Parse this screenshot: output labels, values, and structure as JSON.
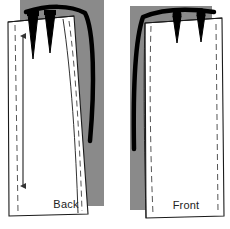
{
  "figure": {
    "kind": "sewing-pattern-diagram",
    "width": 230,
    "height": 229,
    "background_color": "#ffffff"
  },
  "colors": {
    "background": "#ffffff",
    "shadow_gray": "#8a8a8a",
    "piece_fill": "#ffffff",
    "outline": "#1a1a1a",
    "thick_stroke": "#000000",
    "dashed_stitch": "#555555",
    "arrow": "#333333",
    "label_text": "#222222"
  },
  "panels": [
    {
      "id": "back",
      "label": "Back",
      "label_x": 66,
      "label_y": 208,
      "shadow": {
        "name": "back-shadow-block",
        "x": 20,
        "y": 0,
        "width": 84,
        "height": 206,
        "color": "#8a8a8a"
      },
      "piece_outline_points": "8,22 74,16 88,214 9,216",
      "stitch_line_points": "15,25 18,212",
      "side_stitch_points": "69,22 82,211",
      "grainline_arrow": {
        "name": "grainline-arrow",
        "x": 23,
        "y_top": 33,
        "y_bottom": 189,
        "double_headed": true
      },
      "darts": [
        {
          "name": "dart-back-1",
          "apex_x": 33,
          "apex_y": 58,
          "top_left_x": 28,
          "top_right_x": 38,
          "top_y": 18
        },
        {
          "name": "dart-back-2",
          "apex_x": 50,
          "apex_y": 52,
          "top_left_x": 45,
          "top_right_x": 55,
          "top_y": 17
        }
      ],
      "thick_curve": {
        "name": "back-side-seam-heavy-curve",
        "description": "heavy black curved side seam sweeping right then down",
        "path": "M 26 12 C 48 6, 68 6, 84 12 C 92 26, 94 80, 90 140"
      }
    },
    {
      "id": "front",
      "label": "Front",
      "label_x": 186,
      "label_y": 209,
      "shadow": {
        "name": "front-shadow-block",
        "x": 130,
        "y": 6,
        "width": 82,
        "height": 204,
        "color": "#8a8a8a"
      },
      "piece_outline_points": "144,22 222,18 224,216 145,218",
      "stitch_line_points": "151,26 153,214",
      "side_stitch_points": "216,24 218,212",
      "darts": [
        {
          "name": "dart-front-1",
          "apex_x": 177,
          "apex_y": 42,
          "top_left_x": 173,
          "top_right_x": 181,
          "top_y": 15
        },
        {
          "name": "dart-front-2",
          "apex_x": 201,
          "apex_y": 42,
          "top_left_x": 197,
          "top_right_x": 205,
          "top_y": 15
        }
      ],
      "thick_curve": {
        "name": "front-side-seam-heavy-curve",
        "description": "heavy black curved side seam on left sweeping down",
        "path": "M 213 13 C 185 9, 160 10, 142 16 C 135 40, 133 90, 134 148"
      }
    }
  ],
  "icons": {
    "grainline": "double-arrow-icon",
    "dart": "dart-wedge-icon"
  }
}
